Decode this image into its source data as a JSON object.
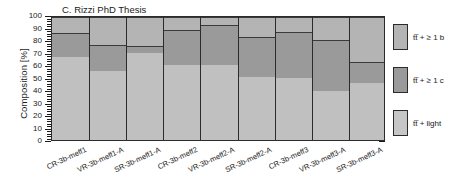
{
  "chart_data": {
    "type": "bar",
    "subtype": "stacked-bar-100-percent",
    "title": "C. Rizzi PhD Thesis",
    "xlabel": "",
    "ylabel": "Composition [%]",
    "ylim": [
      0,
      100
    ],
    "ytick_step": 10,
    "yticks": [
      0,
      10,
      20,
      30,
      40,
      50,
      60,
      70,
      80,
      90,
      100
    ],
    "grid": true,
    "grid_axis": "y",
    "legend_position": "right",
    "categories": [
      "CR-3b-meff1",
      "VR-3b-meff1-A",
      "SR-3b-meff1-A",
      "CR-3b-meff2",
      "VR-3b-meff2-A",
      "SR-3b-meff2-A",
      "CR-3b-meff3",
      "VR-3b-meff3-A",
      "SR-3b-meff3-A"
    ],
    "series": [
      {
        "name": "tt̅ + light",
        "color": "#c0c0c0",
        "values": [
          68,
          57,
          71,
          62,
          62,
          52,
          51,
          41,
          47
        ]
      },
      {
        "name": "tt̅ + ≥ 1 c",
        "color": "#9a9a9a",
        "values": [
          19,
          21,
          6,
          28,
          32,
          32,
          37,
          41,
          17
        ]
      },
      {
        "name": "tt̅ + ≥ 1 b",
        "color": "#b4b4b4",
        "values": [
          13,
          22,
          23,
          10,
          6,
          16,
          12,
          18,
          36
        ]
      }
    ],
    "cumulative_boundaries": [
      [
        68,
        87,
        100
      ],
      [
        57,
        78,
        100
      ],
      [
        71,
        77,
        100
      ],
      [
        62,
        90,
        100
      ],
      [
        62,
        94,
        100
      ],
      [
        52,
        84,
        100
      ],
      [
        51,
        88,
        100
      ],
      [
        41,
        82,
        100
      ],
      [
        47,
        64,
        100
      ]
    ]
  },
  "legend": {
    "entries": [
      {
        "label": "tt̅ + ≥ 1 b",
        "color": "#b4b4b4"
      },
      {
        "label": "tt̅ + ≥ 1 c",
        "color": "#9a9a9a"
      },
      {
        "label": "tt̅ + light",
        "color": "#c6c6c6"
      }
    ]
  },
  "colors": {
    "plot_background": "#c8c8c8",
    "axis": "#2b2b2b",
    "grid": "#8f8f8f",
    "text": "#1a1a1a",
    "page_background": "#ffffff"
  }
}
